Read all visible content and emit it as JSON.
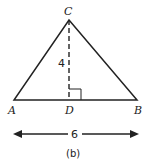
{
  "labels": {
    "A": "A",
    "B": "B",
    "C": "C",
    "D": "D"
  },
  "height_label": "4",
  "base_label": "6",
  "caption": "(b)"
}
